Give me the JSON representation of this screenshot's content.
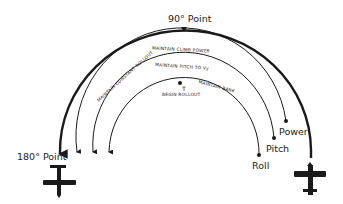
{
  "diagram": {
    "type": "climbing-turn-procedure",
    "labels": {
      "point_90": "90° Point",
      "point_180": "180° Point",
      "maintain_climb_power": "MAINTAIN CLIMB POWER",
      "maintain_pitch": "MAINTAIN PITCH TO Vy",
      "maintain_constant_rollout": "MAINTAIN CONSTANT ROLLOUT",
      "maintain_bank": "MAINTAIN BANK",
      "begin_rollout": "BEGIN ROLLOUT",
      "power": "Power",
      "pitch": "Pitch",
      "roll": "Roll"
    },
    "icons": [
      "airplane-start-icon",
      "airplane-end-icon"
    ],
    "colors": {
      "line": "#1a1a1a",
      "background": "#ffffff"
    }
  }
}
